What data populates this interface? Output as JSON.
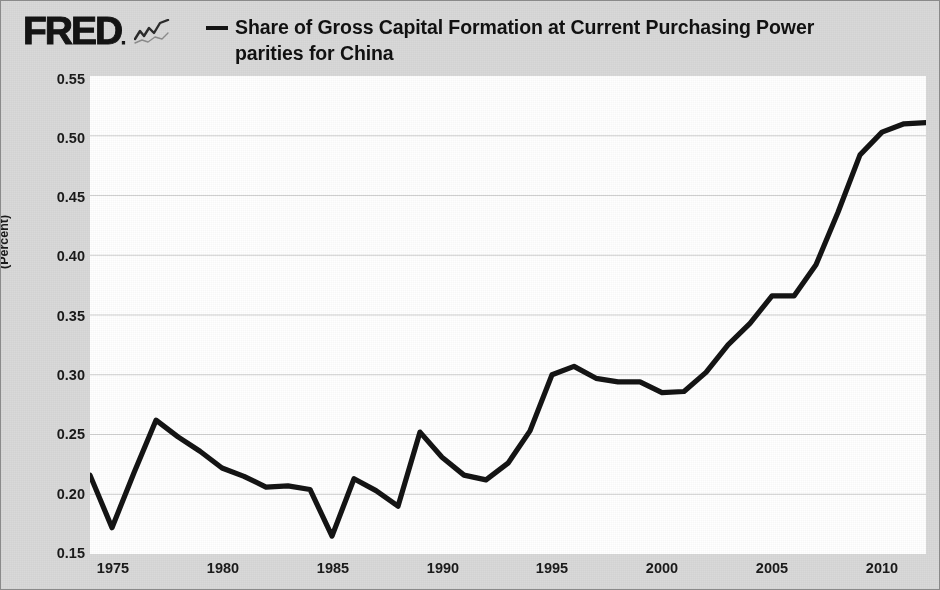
{
  "brand": {
    "logo_text": "FRED",
    "logo_mark": ".",
    "spark_icon": "sparkline-icon"
  },
  "legend": {
    "series_label": "Share of Gross Capital Formation at Current Purchasing Power parities for China",
    "line_color": "#141414",
    "dash_marker": "—"
  },
  "axes": {
    "y_title": "(Percent)",
    "y_ticks": [
      "0.55",
      "0.50",
      "0.45",
      "0.40",
      "0.35",
      "0.30",
      "0.25",
      "0.20",
      "0.15"
    ],
    "x_ticks": [
      "1975",
      "1980",
      "1985",
      "1990",
      "1995",
      "2000",
      "2005",
      "2010"
    ]
  },
  "chart_data": {
    "type": "line",
    "title": "Share of Gross Capital Formation at Current Purchasing Power parities for China",
    "xlabel": "",
    "ylabel": "(Percent)",
    "xlim": [
      1974,
      2012
    ],
    "ylim": [
      0.15,
      0.55
    ],
    "grid": true,
    "grid_axis": "y",
    "legend_position": "top",
    "x_tick_values": [
      1975,
      1980,
      1985,
      1990,
      1995,
      2000,
      2005,
      2010
    ],
    "y_tick_values": [
      0.15,
      0.2,
      0.25,
      0.3,
      0.35,
      0.4,
      0.45,
      0.5,
      0.55
    ],
    "series": [
      {
        "name": "Share of Gross Capital Formation at Current Purchasing Power parities for China",
        "color": "#141414",
        "x": [
          1974,
          1975,
          1976,
          1977,
          1978,
          1979,
          1980,
          1981,
          1982,
          1983,
          1984,
          1985,
          1986,
          1987,
          1988,
          1989,
          1990,
          1991,
          1992,
          1993,
          1994,
          1995,
          1996,
          1997,
          1998,
          1999,
          2000,
          2001,
          2002,
          2003,
          2004,
          2005,
          2006,
          2007,
          2008,
          2009,
          2010,
          2011,
          2012
        ],
        "values": [
          0.216,
          0.172,
          0.218,
          0.262,
          0.248,
          0.236,
          0.222,
          0.215,
          0.206,
          0.207,
          0.204,
          0.165,
          0.213,
          0.203,
          0.19,
          0.252,
          0.231,
          0.216,
          0.212,
          0.226,
          0.253,
          0.3,
          0.307,
          0.297,
          0.294,
          0.294,
          0.285,
          0.286,
          0.302,
          0.325,
          0.343,
          0.366,
          0.366,
          0.392,
          0.436,
          0.484,
          0.503,
          0.51,
          0.511
        ]
      }
    ]
  }
}
